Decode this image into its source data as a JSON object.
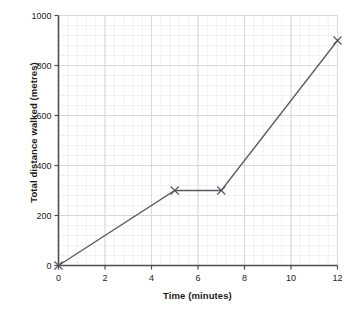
{
  "chart_data": {
    "type": "line",
    "title": "",
    "xlabel": "Time (minutes)",
    "ylabel": "Total distance walked (metres)",
    "xlim": [
      0,
      12
    ],
    "ylim": [
      0,
      1000
    ],
    "xticks": [
      0,
      2,
      4,
      6,
      8,
      10,
      12
    ],
    "yticks": [
      0,
      200,
      400,
      600,
      800,
      1000
    ],
    "xtick_labels": [
      "0",
      "2",
      "4",
      "6",
      "8",
      "10",
      "12"
    ],
    "ytick_labels": [
      "0",
      "200",
      "400",
      "600",
      "800",
      "1000"
    ],
    "x_minor_step": 0.4,
    "y_minor_step": 40,
    "grid": true,
    "grid_minor": true,
    "legend": false,
    "marker": "x",
    "series": [
      {
        "name": "Total distance walked",
        "x": [
          0,
          5,
          7,
          12
        ],
        "values": [
          0,
          300,
          300,
          900
        ],
        "points": [
          {
            "x": 0,
            "y": 0
          },
          {
            "x": 5,
            "y": 300
          },
          {
            "x": 7,
            "y": 300
          },
          {
            "x": 12,
            "y": 900
          }
        ]
      }
    ]
  },
  "style": {
    "line_color": "#5a5a64",
    "marker_color": "#5a5a64",
    "axis_color": "#4d4d4d",
    "grid_major_color": "#d8d8dd",
    "grid_minor_color": "#eeeef1",
    "background": "#ffffff",
    "text_color": "#1b1b1b"
  }
}
